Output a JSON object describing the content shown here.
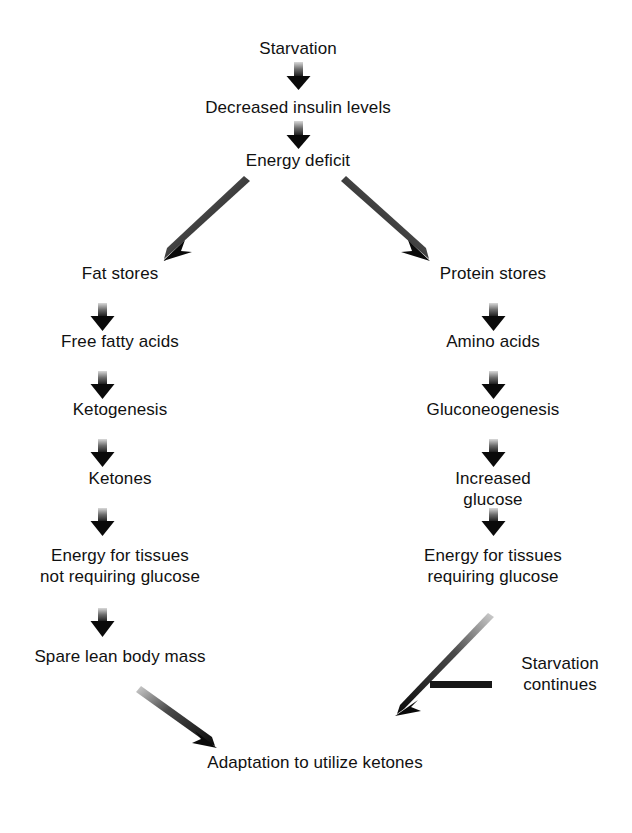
{
  "diagram": {
    "background_color": "#ffffff",
    "text_color": "#111111",
    "arrow_gradient": {
      "from": "#d9d9d9",
      "to": "#0a0a0a"
    }
  },
  "nodes": [
    {
      "id": "starvation",
      "label": "Starvation",
      "x": 298,
      "y": 38
    },
    {
      "id": "decreased-insulin",
      "label": "Decreased insulin levels",
      "x": 298,
      "y": 97
    },
    {
      "id": "energy-deficit",
      "label": "Energy deficit",
      "x": 298,
      "y": 150
    },
    {
      "id": "fat-stores",
      "label": "Fat stores",
      "x": 120,
      "y": 263
    },
    {
      "id": "free-fatty-acids",
      "label": "Free fatty acids",
      "x": 120,
      "y": 345
    },
    {
      "id": "ketogenesis",
      "label": "Ketogenesis",
      "x": 120,
      "y": 413
    },
    {
      "id": "ketones",
      "label": "Ketones",
      "x": 120,
      "y": 481
    },
    {
      "id": "energy-no-glucose",
      "label": "Energy for tissues\nnot requiring glucose",
      "x": 120,
      "y": 548
    },
    {
      "id": "spare-lean-mass",
      "label": "Spare lean body mass",
      "x": 120,
      "y": 651
    },
    {
      "id": "protein-stores",
      "label": "Protein stores",
      "x": 493,
      "y": 263
    },
    {
      "id": "amino-acids",
      "label": "Amino acids",
      "x": 493,
      "y": 345
    },
    {
      "id": "gluconeogenesis",
      "label": "Gluconeogenesis",
      "x": 493,
      "y": 413
    },
    {
      "id": "increased-glucose",
      "label": "Increased glucose",
      "x": 493,
      "y": 481
    },
    {
      "id": "energy-glucose",
      "label": "Energy for tissues\nrequiring glucose",
      "x": 493,
      "y": 548
    },
    {
      "id": "starvation-continues",
      "label": "Starvation\ncontinues",
      "x": 560,
      "y": 663
    },
    {
      "id": "adaptation-ketones",
      "label": "Adaptation to utilize ketones",
      "x": 315,
      "y": 752
    }
  ],
  "arrows": [
    {
      "id": "starvation-to-insulin",
      "kind": "short-vertical",
      "x": 298,
      "y1": 62,
      "y2": 88
    },
    {
      "id": "insulin-to-energy-deficit",
      "kind": "short-vertical",
      "x": 298,
      "y1": 121,
      "y2": 145
    },
    {
      "id": "energy-deficit-to-fat",
      "kind": "diagonal",
      "x1": 248,
      "y1": 183,
      "x2": 165,
      "y2": 258
    },
    {
      "id": "energy-deficit-to-protein",
      "kind": "diagonal",
      "x1": 348,
      "y1": 183,
      "x2": 428,
      "y2": 260
    },
    {
      "id": "fat-to-ffa",
      "kind": "short-vertical",
      "x": 102,
      "y1": 303,
      "y2": 330
    },
    {
      "id": "ffa-to-ketogenesis",
      "kind": "short-vertical",
      "x": 102,
      "y1": 371,
      "y2": 398
    },
    {
      "id": "ketogenesis-to-ketones",
      "kind": "short-vertical",
      "x": 102,
      "y1": 439,
      "y2": 466
    },
    {
      "id": "ketones-to-energy",
      "kind": "short-vertical",
      "x": 102,
      "y1": 508,
      "y2": 535
    },
    {
      "id": "energy-to-spare-mass",
      "kind": "short-vertical",
      "x": 102,
      "y1": 608,
      "y2": 636
    },
    {
      "id": "protein-to-amino",
      "kind": "short-vertical",
      "x": 493,
      "y1": 303,
      "y2": 330
    },
    {
      "id": "amino-to-gluconeogenesis",
      "kind": "short-vertical",
      "x": 493,
      "y1": 371,
      "y2": 398
    },
    {
      "id": "gluconeogenesis-to-glucose",
      "kind": "short-vertical",
      "x": 493,
      "y1": 439,
      "y2": 466
    },
    {
      "id": "glucose-to-energy",
      "kind": "short-vertical",
      "x": 493,
      "y1": 508,
      "y2": 535
    },
    {
      "id": "spare-mass-to-adaptation",
      "kind": "diagonal",
      "x1": 142,
      "y1": 688,
      "x2": 214,
      "y2": 744
    },
    {
      "id": "energy-glucose-to-adaptation",
      "kind": "diagonal",
      "x1": 490,
      "y1": 618,
      "x2": 400,
      "y2": 714
    },
    {
      "id": "starvation-continues-connector",
      "kind": "horizontal",
      "x1": 492,
      "y1": 685,
      "x2": 430,
      "y2": 685
    }
  ]
}
